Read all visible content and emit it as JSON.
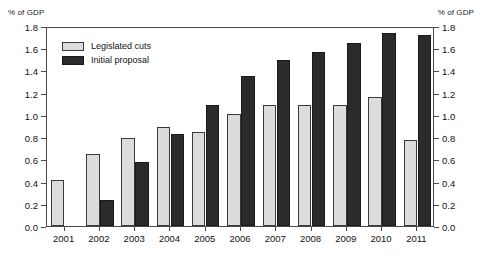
{
  "chart_data": {
    "type": "bar",
    "title": "",
    "subtitle": "",
    "xlabel": "",
    "ylabel": "% of GDP",
    "ylabel_right": "% of GDP",
    "ylim": [
      0.0,
      1.8
    ],
    "ytick_step": 0.2,
    "yticks": [
      "0.0",
      "0.2",
      "0.4",
      "0.6",
      "0.8",
      "1.0",
      "1.2",
      "1.4",
      "1.6",
      "1.8"
    ],
    "grid": false,
    "legend_position": "top-left",
    "categories": [
      "2001",
      "2002",
      "2003",
      "2004",
      "2005",
      "2006",
      "2007",
      "2008",
      "2009",
      "2010",
      "2011"
    ],
    "series": [
      {
        "name": "Legislated cuts",
        "color": "#dcdcdc",
        "values": [
          0.41,
          0.65,
          0.79,
          0.89,
          0.85,
          1.01,
          1.09,
          1.09,
          1.09,
          1.16,
          0.77
        ]
      },
      {
        "name": "Initial proposal",
        "color": "#2b2b2b",
        "values": [
          null,
          0.23,
          0.58,
          0.83,
          1.09,
          1.35,
          1.49,
          1.57,
          1.65,
          1.74,
          1.72
        ]
      }
    ]
  },
  "axes": {
    "left_caption": "% of GDP",
    "right_caption": "% of GDP"
  }
}
